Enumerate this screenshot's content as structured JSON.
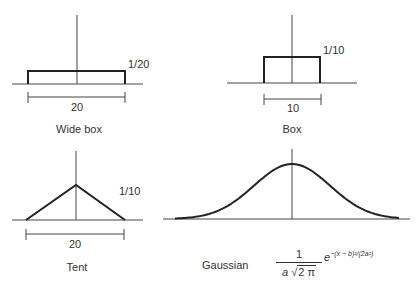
{
  "panels": [
    {
      "id": "wide-box",
      "caption": "Wide box",
      "height_label": "1/20",
      "width_label": "20"
    },
    {
      "id": "box",
      "caption": "Box",
      "height_label": "1/10",
      "width_label": "10"
    },
    {
      "id": "tent",
      "caption": "Tent",
      "height_label": "1/10",
      "width_label": "20"
    },
    {
      "id": "gaussian",
      "caption": "Gaussian",
      "formula": {
        "numerator": "1",
        "denominator_a": "a",
        "denominator_sqrt": "2 π",
        "base": "e",
        "exponent": "−(x − b)²/(2a²)"
      }
    }
  ],
  "colors": {
    "line": "#2a2a2a",
    "axis": "#444444",
    "background": "#ffffff"
  }
}
